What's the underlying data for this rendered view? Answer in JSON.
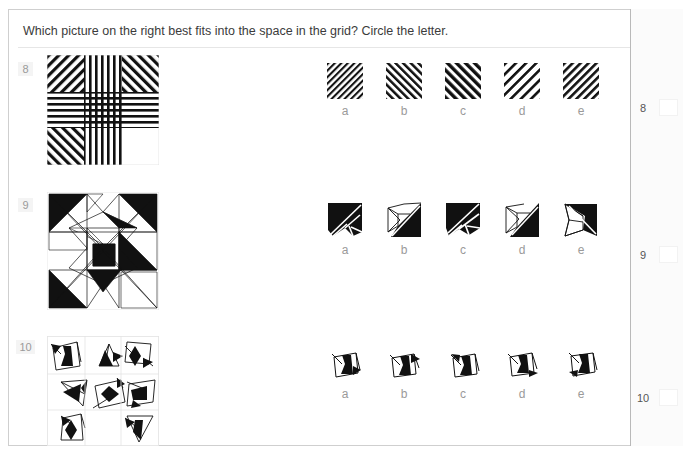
{
  "page": {
    "top_ghost_text": "",
    "prompt": "Which picture on the right best fits into the space in the grid? Circle the letter."
  },
  "answer_column": {
    "rows": [
      {
        "number": "8",
        "value": ""
      },
      {
        "number": "9",
        "value": ""
      },
      {
        "number": "10",
        "value": ""
      }
    ]
  },
  "questions": [
    {
      "number": "8",
      "grid": {
        "rows": 3,
        "cols": 3,
        "missing_cell": {
          "row": 2,
          "col": 2
        },
        "cell_patterns": [
          [
            "diagonal-stripes-backslash",
            "vertical-stripes",
            "diagonal-stripes-slash"
          ],
          [
            "horizontal-stripes",
            "crosshatch-stripes",
            "horizontal-stripes"
          ],
          [
            "diagonal-stripes-slash",
            "vertical-stripes",
            "blank"
          ]
        ]
      },
      "options": [
        {
          "letter": "a",
          "pattern": "diagonal-stripes-backslash-fine"
        },
        {
          "letter": "b",
          "pattern": "diagonal-stripes-slash-medium"
        },
        {
          "letter": "c",
          "pattern": "diagonal-stripes-slash-bold"
        },
        {
          "letter": "d",
          "pattern": "diagonal-stripes-backslash-sparse"
        },
        {
          "letter": "e",
          "pattern": "diagonal-stripes-backslash-medium"
        }
      ]
    },
    {
      "number": "9",
      "grid": {
        "rows": 3,
        "cols": 3,
        "missing_cell": {
          "row": 1,
          "col": 2
        },
        "cell_patterns": [
          [
            "black-triangle-nw",
            "white-star-point",
            "black-triangle-ne"
          ],
          [
            "white-bowtie",
            "black-square-center",
            "blank"
          ],
          [
            "black-triangle-sw",
            "black-arrow-down",
            "white-triangle-se"
          ]
        ]
      },
      "options": [
        {
          "letter": "a",
          "pattern": "black-square-diagonal-split-left"
        },
        {
          "letter": "b",
          "pattern": "black-triangle-right-diagonal"
        },
        {
          "letter": "c",
          "pattern": "black-square-diagonal-split-fan"
        },
        {
          "letter": "d",
          "pattern": "black-triangle-right-thin"
        },
        {
          "letter": "e",
          "pattern": "black-triangle-right-narrow"
        }
      ]
    },
    {
      "number": "10",
      "grid": {
        "rows": 3,
        "cols": 3,
        "missing_cell": {
          "row": 2,
          "col": 1
        },
        "cell_patterns": [
          [
            "quad-black-blob-left-arrow",
            "triangle-black-arrow-right",
            "quad-black-diamond-arrow"
          ],
          [
            "triangle-arrow-left",
            "quad-black-diamond",
            "quad-black-flag"
          ],
          [
            "quad-black-diamond-small",
            "blank",
            "triangle-black-down-arrow"
          ]
        ]
      },
      "options": [
        {
          "letter": "a",
          "pattern": "quad-black-blob-arrow-right"
        },
        {
          "letter": "b",
          "pattern": "quad-black-blob-arrow-upper-right"
        },
        {
          "letter": "c",
          "pattern": "quad-black-blob-arrow-upper-left"
        },
        {
          "letter": "d",
          "pattern": "quad-black-blob-arrow-lower-right"
        },
        {
          "letter": "e",
          "pattern": "quad-black-blob-arrow-lower-left"
        }
      ]
    }
  ],
  "colors": {
    "ink": "#000000",
    "text": "#3b3b3b",
    "muted": "#9a9a9a",
    "rule": "#e6e6e6",
    "border": "#cfcfcf",
    "badge_bg": "#f4f4f4",
    "panel_bg": "#fbfbfb"
  }
}
